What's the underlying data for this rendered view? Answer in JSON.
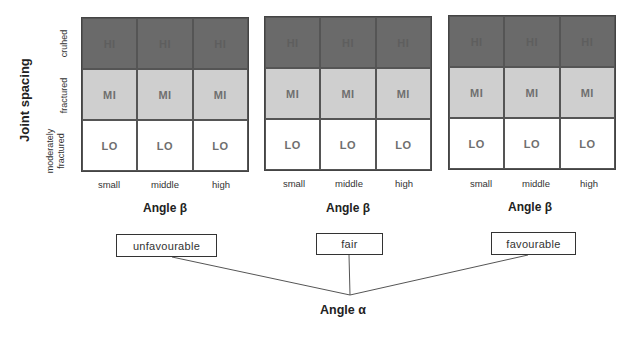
{
  "y_axis": {
    "title": "Joint spacing",
    "rows": [
      {
        "label": "cruhed"
      },
      {
        "label": "fractured"
      },
      {
        "label_line1": "moderately",
        "label_line2": "fractured"
      }
    ]
  },
  "panels": [
    {
      "x_title": "Angle β",
      "columns": [
        "small",
        "middle",
        "high"
      ],
      "cells": [
        [
          "HI",
          "HI",
          "HI"
        ],
        [
          "MI",
          "MI",
          "MI"
        ],
        [
          "LO",
          "LO",
          "LO"
        ]
      ],
      "alpha_category": "unfavourable"
    },
    {
      "x_title": "Angle β",
      "columns": [
        "small",
        "middle",
        "high"
      ],
      "cells": [
        [
          "HI",
          "HI",
          "HI"
        ],
        [
          "MI",
          "MI",
          "MI"
        ],
        [
          "LO",
          "LO",
          "LO"
        ]
      ],
      "alpha_category": "fair"
    },
    {
      "x_title": "Angle β",
      "columns": [
        "small",
        "middle",
        "high"
      ],
      "cells": [
        [
          "HI",
          "HI",
          "HI"
        ],
        [
          "MI",
          "MI",
          "MI"
        ],
        [
          "LO",
          "LO",
          "LO"
        ]
      ],
      "alpha_category": "favourable"
    }
  ],
  "alpha": {
    "title": "Angle α"
  },
  "colors": {
    "hi": "#6a6a6a",
    "mi": "#cfcfcf",
    "lo": "#ffffff",
    "line": "#444444"
  }
}
